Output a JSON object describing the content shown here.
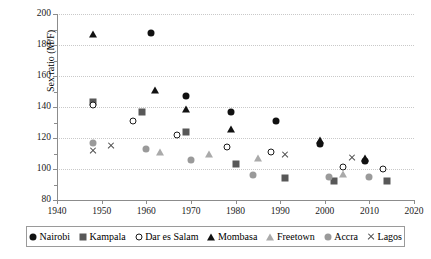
{
  "chart_data": {
    "type": "scatter",
    "title": "",
    "xlabel": "",
    "ylabel": "Sex ratio (M/F)",
    "xlim": [
      1940,
      2020
    ],
    "ylim": [
      80,
      200
    ],
    "xticks": [
      1940,
      1950,
      1960,
      1970,
      1980,
      1990,
      2000,
      2010,
      2020
    ],
    "yticks": [
      80,
      100,
      120,
      140,
      160,
      180,
      200
    ],
    "grid": "horizontal-dotted",
    "legend_position": "bottom",
    "series": [
      {
        "name": "Nairobi",
        "marker": "circle-filled",
        "color": "#111111",
        "points": [
          {
            "x": 1961,
            "y": 188
          },
          {
            "x": 1969,
            "y": 147
          },
          {
            "x": 1979,
            "y": 137
          },
          {
            "x": 1989,
            "y": 131
          },
          {
            "x": 1999,
            "y": 116
          },
          {
            "x": 2009,
            "y": 105
          }
        ]
      },
      {
        "name": "Kampala",
        "marker": "square",
        "color": "#585858",
        "points": [
          {
            "x": 1948,
            "y": 143
          },
          {
            "x": 1959,
            "y": 137
          },
          {
            "x": 1969,
            "y": 124
          },
          {
            "x": 1980,
            "y": 103
          },
          {
            "x": 1991,
            "y": 94
          },
          {
            "x": 2002,
            "y": 92
          },
          {
            "x": 2014,
            "y": 92
          }
        ]
      },
      {
        "name": "Dar es Salam",
        "marker": "circle-open",
        "color": "#1a1a1a",
        "points": [
          {
            "x": 1948,
            "y": 141
          },
          {
            "x": 1957,
            "y": 131
          },
          {
            "x": 1967,
            "y": 122
          },
          {
            "x": 1978,
            "y": 114
          },
          {
            "x": 1988,
            "y": 111
          },
          {
            "x": 2004,
            "y": 101
          },
          {
            "x": 2013,
            "y": 100
          }
        ]
      },
      {
        "name": "Mombasa",
        "marker": "triangle-filled",
        "color": "#111111",
        "points": [
          {
            "x": 1948,
            "y": 187
          },
          {
            "x": 1962,
            "y": 151
          },
          {
            "x": 1969,
            "y": 139
          },
          {
            "x": 1979,
            "y": 126
          },
          {
            "x": 1999,
            "y": 119
          },
          {
            "x": 2009,
            "y": 107
          }
        ]
      },
      {
        "name": "Freetown",
        "marker": "triangle-light",
        "color": "#aaaaaa",
        "points": [
          {
            "x": 1963,
            "y": 111
          },
          {
            "x": 1974,
            "y": 110
          },
          {
            "x": 1985,
            "y": 107
          },
          {
            "x": 2004,
            "y": 97
          }
        ]
      },
      {
        "name": "Accra",
        "marker": "circle-gray",
        "color": "#9a9a9a",
        "points": [
          {
            "x": 1948,
            "y": 117
          },
          {
            "x": 1960,
            "y": 113
          },
          {
            "x": 1970,
            "y": 106
          },
          {
            "x": 1984,
            "y": 96
          },
          {
            "x": 2001,
            "y": 95
          },
          {
            "x": 2010,
            "y": 95
          }
        ]
      },
      {
        "name": "Lagos",
        "marker": "cross",
        "color": "#4a4a4a",
        "points": [
          {
            "x": 1948,
            "y": 112
          },
          {
            "x": 1952,
            "y": 115
          },
          {
            "x": 1991,
            "y": 109
          },
          {
            "x": 2006,
            "y": 107
          }
        ]
      }
    ]
  },
  "legend": {
    "items": [
      {
        "label": "Nairobi"
      },
      {
        "label": "Kampala"
      },
      {
        "label": "Dar es Salam"
      },
      {
        "label": "Mombasa"
      },
      {
        "label": "Freetown"
      },
      {
        "label": "Accra"
      },
      {
        "label": "Lagos"
      }
    ]
  }
}
